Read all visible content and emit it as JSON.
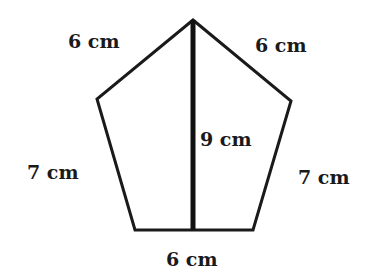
{
  "diagram": {
    "shape": "pentagon",
    "stroke_color": "#1a1a1a",
    "vertices": {
      "top": [
        193,
        20
      ],
      "upper_left": [
        97,
        99
      ],
      "upper_right": [
        291,
        101
      ],
      "lower_left": [
        135,
        230
      ],
      "lower_right": [
        253,
        230
      ]
    },
    "height_line": {
      "from": [
        193,
        20
      ],
      "to": [
        193,
        230
      ]
    },
    "labels": {
      "top_left_side": "6 cm",
      "top_right_side": "6 cm",
      "left_side": "7 cm",
      "right_side": "7 cm",
      "bottom_side": "6 cm",
      "height": "9 cm"
    }
  }
}
